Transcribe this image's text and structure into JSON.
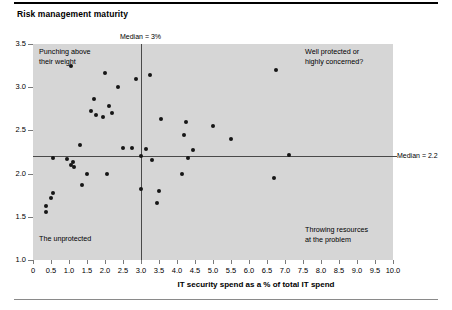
{
  "chart": {
    "title": "Risk management maturity",
    "xaxis_title": "IT security spend as a % of total IT spend",
    "median_x_label": "Median = 3%",
    "median_y_label": "Median = 2.2",
    "quadrants": {
      "top_left_line1": "Punching above",
      "top_left_line2": "their weight",
      "top_right_line1": "Well protected or",
      "top_right_line2": "highly concerned?",
      "bottom_left_line1": "The unprotected",
      "bottom_right_line1": "Throwing resources",
      "bottom_right_line2": "at the problem"
    }
  },
  "chart_data": {
    "type": "scatter",
    "title": "Risk management maturity",
    "xlabel": "IT security spend as a % of total IT spend",
    "ylabel": "",
    "xlim": [
      0,
      10.0
    ],
    "ylim": [
      1.0,
      3.5
    ],
    "xticks": [
      "0",
      "0.5",
      "1.0",
      "1.5",
      "2.0",
      "2.5",
      "3.0",
      "3.5",
      "4.0",
      "4.5",
      "5.0",
      "5.5",
      "6.0",
      "6.5",
      "7.0",
      "7.5",
      "8.0",
      "8.5",
      "9.0",
      "9.5",
      "10.0"
    ],
    "yticks": [
      "1.0",
      "1.5",
      "2.0",
      "2.5",
      "3.0",
      "3.5"
    ],
    "grid": false,
    "legend": "none",
    "plot_background": "#d6d6d6",
    "point_color": "#161616",
    "reference_lines": [
      {
        "orientation": "vertical",
        "value": 3.0,
        "label": "Median = 3%",
        "color": "#4a4a4a"
      },
      {
        "orientation": "horizontal",
        "value": 2.2,
        "label": "Median = 2.2",
        "color": "#4a4a4a"
      }
    ],
    "annotations": [
      {
        "text": "Punching above their weight",
        "quadrant": "top-left"
      },
      {
        "text": "Well protected or highly concerned?",
        "quadrant": "top-right"
      },
      {
        "text": "The unprotected",
        "quadrant": "bottom-left"
      },
      {
        "text": "Throwing resources at the problem",
        "quadrant": "bottom-right"
      }
    ],
    "points": [
      {
        "x": 1.05,
        "y": 3.25
      },
      {
        "x": 2.0,
        "y": 3.17
      },
      {
        "x": 2.85,
        "y": 3.1
      },
      {
        "x": 3.25,
        "y": 3.14
      },
      {
        "x": 2.35,
        "y": 3.0
      },
      {
        "x": 1.7,
        "y": 2.86
      },
      {
        "x": 2.1,
        "y": 2.78
      },
      {
        "x": 1.6,
        "y": 2.72
      },
      {
        "x": 2.2,
        "y": 2.7
      },
      {
        "x": 1.75,
        "y": 2.68
      },
      {
        "x": 1.95,
        "y": 2.65
      },
      {
        "x": 6.75,
        "y": 3.2
      },
      {
        "x": 3.55,
        "y": 2.63
      },
      {
        "x": 4.25,
        "y": 2.6
      },
      {
        "x": 5.0,
        "y": 2.55
      },
      {
        "x": 4.2,
        "y": 2.45
      },
      {
        "x": 5.5,
        "y": 2.4
      },
      {
        "x": 1.3,
        "y": 2.33
      },
      {
        "x": 2.5,
        "y": 2.3
      },
      {
        "x": 2.75,
        "y": 2.3
      },
      {
        "x": 3.15,
        "y": 2.28
      },
      {
        "x": 4.45,
        "y": 2.27
      },
      {
        "x": 7.1,
        "y": 2.22
      },
      {
        "x": 3.0,
        "y": 2.2
      },
      {
        "x": 0.55,
        "y": 2.18
      },
      {
        "x": 0.95,
        "y": 2.17
      },
      {
        "x": 1.1,
        "y": 2.13
      },
      {
        "x": 3.3,
        "y": 2.16
      },
      {
        "x": 4.3,
        "y": 2.18
      },
      {
        "x": 1.05,
        "y": 2.1
      },
      {
        "x": 1.15,
        "y": 2.08
      },
      {
        "x": 1.5,
        "y": 2.0
      },
      {
        "x": 2.05,
        "y": 2.0
      },
      {
        "x": 4.15,
        "y": 2.0
      },
      {
        "x": 1.35,
        "y": 1.87
      },
      {
        "x": 3.0,
        "y": 1.82
      },
      {
        "x": 0.55,
        "y": 1.78
      },
      {
        "x": 0.5,
        "y": 1.72
      },
      {
        "x": 3.5,
        "y": 1.8
      },
      {
        "x": 3.45,
        "y": 1.66
      },
      {
        "x": 6.7,
        "y": 1.95
      },
      {
        "x": 0.35,
        "y": 1.63
      },
      {
        "x": 0.35,
        "y": 1.56
      }
    ]
  }
}
